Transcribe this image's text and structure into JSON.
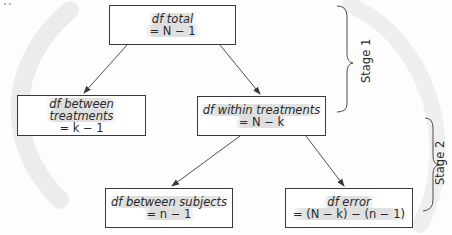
{
  "diagram": {
    "title": "",
    "nodes": {
      "total": {
        "label": "df total",
        "formula": "= N − 1"
      },
      "between_treatments": {
        "label_line1": "df between",
        "label_line2": "treatments",
        "formula": "= k − 1"
      },
      "within_treatments": {
        "label": "df within treatments",
        "formula": "= N − k"
      },
      "between_subjects": {
        "label": "df between subjects",
        "formula": "= n − 1"
      },
      "error": {
        "label": "df error",
        "formula": "= (N − k) − (n − 1)"
      }
    },
    "edges": [
      {
        "from": "total",
        "to": "between_treatments"
      },
      {
        "from": "total",
        "to": "within_treatments"
      },
      {
        "from": "within_treatments",
        "to": "between_subjects"
      },
      {
        "from": "within_treatments",
        "to": "error"
      }
    ],
    "stages": [
      {
        "label": "Stage 1"
      },
      {
        "label": "Stage 2"
      }
    ],
    "colors": {
      "line": "#3a3a3a",
      "text": "#2a2a2a",
      "highlight": "#b8b8b8"
    }
  }
}
